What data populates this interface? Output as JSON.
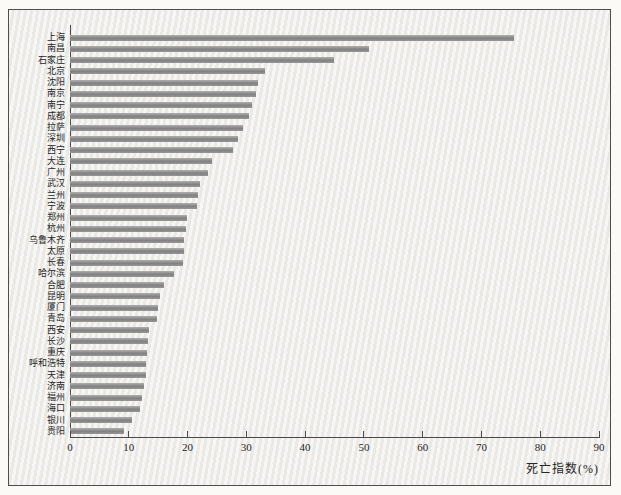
{
  "chart_data": {
    "type": "bar",
    "orientation": "horizontal",
    "title": "",
    "xlabel": "死亡指数(%)",
    "ylabel": "",
    "xlim": [
      0,
      90
    ],
    "xticks": [
      0,
      10,
      20,
      30,
      40,
      50,
      60,
      70,
      80,
      90
    ],
    "grid": false,
    "legend": "none",
    "bar_color": "#8f8f8f",
    "axis_color": "#4a4a4a",
    "background_color": "#f1f0ed",
    "categories": [
      "上海",
      "南昌",
      "石家庄",
      "北京",
      "沈阳",
      "南京",
      "南宁",
      "成都",
      "拉萨",
      "深圳",
      "西宁",
      "大连",
      "广州",
      "武汉",
      "兰州",
      "宁波",
      "郑州",
      "杭州",
      "乌鲁木齐",
      "太原",
      "长春",
      "哈尔滨",
      "合肥",
      "昆明",
      "厦门",
      "青岛",
      "西安",
      "长沙",
      "重庆",
      "呼和浩特",
      "天津",
      "济南",
      "福州",
      "海口",
      "银川",
      "贵阳"
    ],
    "values": [
      75.6,
      51.0,
      45.0,
      33.2,
      32.0,
      31.7,
      31.0,
      30.5,
      29.5,
      28.6,
      27.8,
      24.2,
      23.5,
      22.2,
      21.8,
      21.6,
      20.0,
      19.7,
      19.5,
      19.5,
      19.3,
      17.7,
      16.0,
      15.3,
      15.0,
      14.8,
      13.4,
      13.3,
      13.1,
      12.9,
      12.9,
      12.6,
      12.2,
      11.9,
      10.5,
      9.2
    ]
  }
}
